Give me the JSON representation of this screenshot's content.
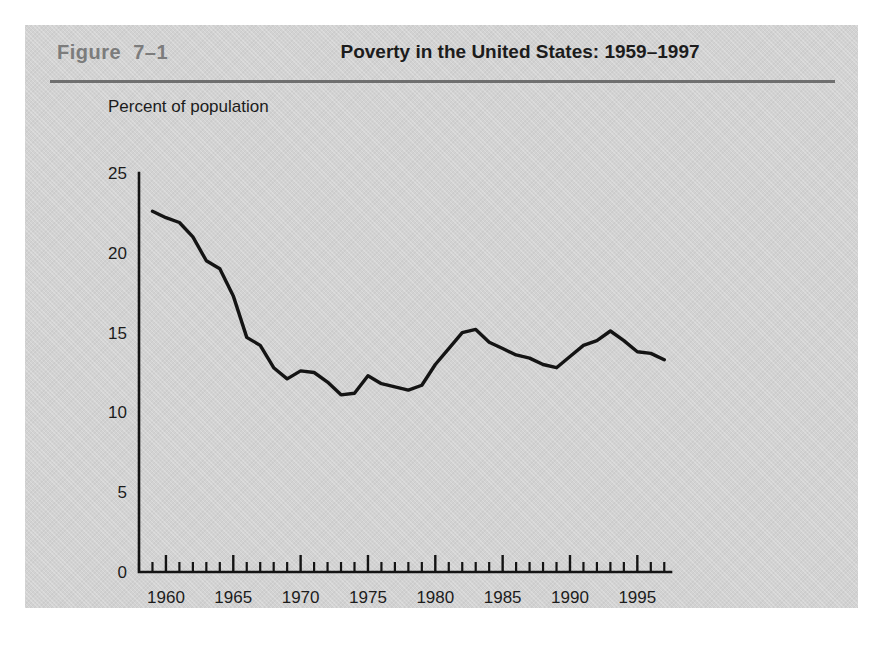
{
  "figure": {
    "number_label": "Figure  7–1",
    "title": "Poverty in the United States: 1959–1997",
    "panel_color": "#d2d2d2",
    "number_color": "#7c7c7c",
    "rule_color": "#6f6f6f"
  },
  "chart_data": {
    "type": "line",
    "title": "Poverty in the United States: 1959–1997",
    "xlabel": "",
    "ylabel": "Percent of population",
    "ylim": [
      0,
      25
    ],
    "xlim": [
      1958,
      1997.5
    ],
    "yticks": [
      0,
      5,
      10,
      15,
      20,
      25
    ],
    "ytick_labels": [
      "0",
      "5",
      "10",
      "15",
      "20",
      "25"
    ],
    "xticks_major": [
      1960,
      1965,
      1970,
      1975,
      1980,
      1985,
      1990,
      1995
    ],
    "xtick_labels": [
      "1960",
      "1965",
      "1970",
      "1975",
      "1980",
      "1985",
      "1990",
      "1995"
    ],
    "xtick_minor_step": 1,
    "grid": false,
    "legend": false,
    "line_color": "#141414",
    "series": [
      {
        "name": "Poverty rate",
        "x": [
          1959,
          1960,
          1961,
          1962,
          1963,
          1964,
          1965,
          1966,
          1967,
          1968,
          1969,
          1970,
          1971,
          1972,
          1973,
          1974,
          1975,
          1976,
          1977,
          1978,
          1979,
          1980,
          1981,
          1982,
          1983,
          1984,
          1985,
          1986,
          1987,
          1988,
          1989,
          1990,
          1991,
          1992,
          1993,
          1994,
          1995,
          1996,
          1997
        ],
        "values": [
          22.6,
          22.2,
          21.9,
          21.0,
          19.5,
          19.0,
          17.3,
          14.7,
          14.2,
          12.8,
          12.1,
          12.6,
          12.5,
          11.9,
          11.1,
          11.2,
          12.3,
          11.8,
          11.6,
          11.4,
          11.7,
          13.0,
          14.0,
          15.0,
          15.2,
          14.4,
          14.0,
          13.6,
          13.4,
          13.0,
          12.8,
          13.5,
          14.2,
          14.5,
          15.1,
          14.5,
          13.8,
          13.7,
          13.3
        ]
      }
    ]
  }
}
